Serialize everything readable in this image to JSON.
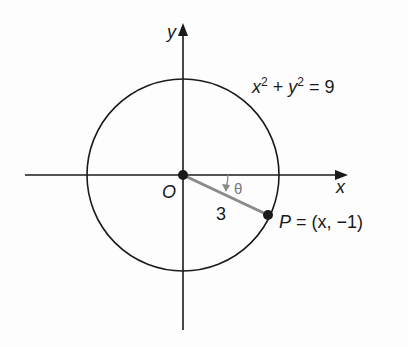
{
  "diagram": {
    "axes": {
      "x_label": "x",
      "y_label": "y"
    },
    "origin_label": "O",
    "equation": {
      "x": "x",
      "y": "y",
      "exp": "2",
      "rest": " = 9",
      "plus": " + "
    },
    "radius_label": "3",
    "angle_label": "θ",
    "point_label": {
      "name": "P",
      "coords": " = (x, −1)"
    },
    "colors": {
      "stroke": "#1a1a1a",
      "segment": "#8a8a8a",
      "background": "#fdfdfd"
    }
  }
}
